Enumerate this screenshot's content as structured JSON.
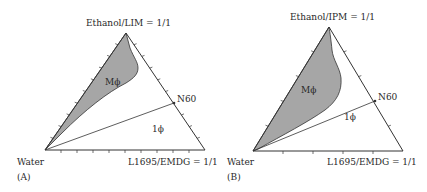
{
  "panels": [
    {
      "id": "A",
      "panel_label": "(A)",
      "top_vertex": "Ethanol/LIM = 1/1",
      "left_vertex": "Water",
      "right_vertex": "L1695/EMDG = 1/1",
      "dilution_point": "N60",
      "shaded_region_label": "Mϕ",
      "clear_region_label": "1ϕ"
    },
    {
      "id": "B",
      "panel_label": "(B)",
      "top_vertex": "Ethanol/IPM = 1/1",
      "left_vertex": "Water",
      "right_vertex": "L1695/EMDG = 1/1",
      "dilution_point": "N60",
      "shaded_region_label": "Mϕ",
      "clear_region_label": "1ϕ"
    }
  ],
  "colors": {
    "shaded_fill": "#a6a6a6",
    "line": "#333333",
    "text": "#2a2a2a"
  }
}
